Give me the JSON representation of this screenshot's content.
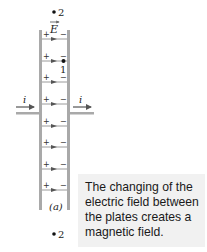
{
  "figure": {
    "label": "(a)",
    "caption": "The changing of the electric field between the plates creates a magnetic field.",
    "field_label": "E",
    "current_label_left": "i",
    "current_label_right": "i",
    "points": [
      {
        "label": "2",
        "position": "above plates"
      },
      {
        "label": "1",
        "position": "between plates"
      },
      {
        "label": "2",
        "position": "below plates"
      }
    ],
    "plus_sign": "+",
    "minus_sign": "−",
    "field_line_count": 8,
    "colors": {
      "plate": "#a9a9a9",
      "wire": "#a9a9a9",
      "field_line": "#9a9a9a",
      "arrow": "#555555",
      "caption_bg": "#f1f1f1",
      "text": "#222222"
    }
  }
}
